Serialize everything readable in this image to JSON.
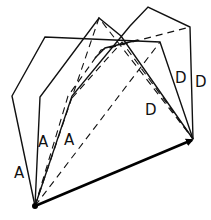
{
  "diagram": {
    "labels": {
      "a1": "A",
      "a2": "A",
      "a3": "A",
      "d1": "D",
      "d2": "D",
      "d3": "D"
    },
    "colors": {
      "stroke": "#111111",
      "background": "#ffffff"
    }
  }
}
